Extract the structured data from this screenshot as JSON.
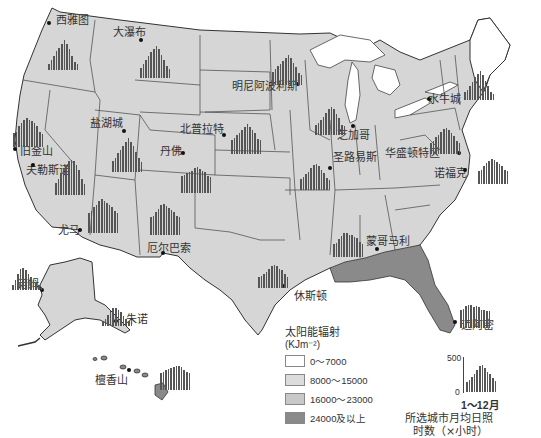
{
  "map": {
    "subject": "美国太阳能辐射与主要城市月均日照时数",
    "colors": {
      "water_bg": "#ffffff",
      "class_0_7000": "#ffffff",
      "class_8000_15000": "#d9d9d9",
      "class_16000_23000": "#cfcfcf",
      "class_24000_plus": "#8a8a8a",
      "border": "#333333",
      "bars": "#555555"
    }
  },
  "cities": [
    {
      "name": "西雅图",
      "label_x": 56,
      "label_y": 15,
      "dot_x": 49,
      "dot_y": 23,
      "hist_x": 48,
      "hist_y": 30,
      "values": [
        80,
        120,
        180,
        240,
        280,
        330,
        380,
        330,
        260,
        180,
        100,
        70
      ]
    },
    {
      "name": "大瀑布",
      "label_x": 113,
      "label_y": 27,
      "dot_x": 141,
      "dot_y": 40,
      "hist_x": 140,
      "hist_y": 38,
      "values": [
        120,
        170,
        230,
        280,
        320,
        360,
        400,
        360,
        290,
        220,
        150,
        110
      ]
    },
    {
      "name": "明尼阿波利斯",
      "label_x": 232,
      "label_y": 81,
      "dot_x": 298,
      "dot_y": 84,
      "hist_x": 272,
      "hist_y": 45,
      "values": [
        160,
        200,
        240,
        260,
        300,
        340,
        380,
        340,
        280,
        220,
        150,
        130
      ]
    },
    {
      "name": "水牛城",
      "label_x": 428,
      "label_y": 94,
      "dot_x": 429,
      "dot_y": 99,
      "hist_x": 464,
      "hist_y": 60,
      "values": [
        100,
        130,
        180,
        230,
        290,
        330,
        360,
        310,
        240,
        180,
        100,
        80
      ]
    },
    {
      "name": "盐湖城",
      "label_x": 90,
      "label_y": 118,
      "dot_x": 124,
      "dot_y": 131,
      "hist_x": 112,
      "hist_y": 132,
      "values": [
        140,
        170,
        240,
        280,
        330,
        380,
        420,
        380,
        320,
        250,
        170,
        130
      ]
    },
    {
      "name": "北普拉特",
      "label_x": 180,
      "label_y": 124,
      "dot_x": 224,
      "dot_y": 135,
      "hist_x": 231,
      "hist_y": 114,
      "values": [
        180,
        200,
        240,
        260,
        300,
        340,
        380,
        340,
        300,
        260,
        190,
        170
      ]
    },
    {
      "name": "芝加哥",
      "label_x": 337,
      "label_y": 130,
      "dot_x": 353,
      "dot_y": 126,
      "hist_x": 315,
      "hist_y": 95,
      "values": [
        130,
        150,
        190,
        230,
        280,
        320,
        350,
        320,
        260,
        210,
        130,
        110
      ]
    },
    {
      "name": "旧金山",
      "label_x": 20,
      "label_y": 146,
      "dot_x": 15,
      "dot_y": 149,
      "hist_x": 13,
      "hist_y": 107,
      "values": [
        170,
        190,
        260,
        300,
        340,
        360,
        340,
        320,
        300,
        260,
        190,
        160
      ]
    },
    {
      "name": "丹佛",
      "label_x": 160,
      "label_y": 146,
      "dot_x": 183,
      "dot_y": 153,
      "hist_x": 181,
      "hist_y": 153,
      "values": [
        210,
        220,
        250,
        260,
        280,
        310,
        320,
        300,
        280,
        260,
        210,
        200
      ]
    },
    {
      "name": "圣路易斯",
      "label_x": 333,
      "label_y": 152,
      "dot_x": 330,
      "dot_y": 168,
      "hist_x": 300,
      "hist_y": 150,
      "values": [
        140,
        160,
        200,
        230,
        280,
        310,
        330,
        300,
        250,
        210,
        150,
        130
      ]
    },
    {
      "name": "华盛顿特区",
      "label_x": 385,
      "label_y": 148,
      "dot_x": 459,
      "dot_y": 153,
      "hist_x": 430,
      "hist_y": 114,
      "values": [
        140,
        160,
        210,
        240,
        280,
        310,
        330,
        300,
        260,
        220,
        160,
        140
      ]
    },
    {
      "name": "夫勒斯诺",
      "label_x": 26,
      "label_y": 165,
      "dot_x": 33,
      "dot_y": 165,
      "hist_x": 55,
      "hist_y": 155,
      "values": [
        150,
        200,
        270,
        320,
        380,
        420,
        440,
        420,
        370,
        310,
        200,
        140
      ]
    },
    {
      "name": "诺福克",
      "label_x": 434,
      "label_y": 168,
      "dot_x": 465,
      "dot_y": 170,
      "hist_x": 478,
      "hist_y": 144,
      "values": [
        160,
        180,
        220,
        260,
        290,
        310,
        300,
        280,
        250,
        230,
        180,
        160
      ]
    },
    {
      "name": "尤马",
      "label_x": 58,
      "label_y": 225,
      "dot_x": 80,
      "dot_y": 230,
      "hist_x": 88,
      "hist_y": 193,
      "values": [
        250,
        270,
        320,
        350,
        400,
        420,
        400,
        380,
        350,
        320,
        270,
        250
      ]
    },
    {
      "name": "厄尔巴索",
      "label_x": 147,
      "label_y": 243,
      "dot_x": 163,
      "dot_y": 253,
      "hist_x": 150,
      "hist_y": 195,
      "values": [
        220,
        240,
        290,
        330,
        370,
        390,
        360,
        340,
        310,
        290,
        240,
        220
      ]
    },
    {
      "name": "蒙哥马利",
      "label_x": 366,
      "label_y": 236,
      "dot_x": 377,
      "dot_y": 249,
      "hist_x": 333,
      "hist_y": 217,
      "values": [
        160,
        180,
        220,
        260,
        300,
        300,
        280,
        270,
        250,
        240,
        190,
        160
      ]
    },
    {
      "name": "休斯顿",
      "label_x": 294,
      "label_y": 291,
      "dot_x": 283,
      "dot_y": 286,
      "hist_x": 258,
      "hist_y": 248,
      "values": [
        140,
        150,
        180,
        200,
        240,
        280,
        290,
        280,
        240,
        230,
        170,
        140
      ]
    },
    {
      "name": "诺姆",
      "label_x": 17,
      "label_y": 279,
      "dot_x": 42,
      "dot_y": 290,
      "hist_x": 12,
      "hist_y": 250,
      "values": [
        60,
        120,
        200,
        260,
        280,
        250,
        200,
        160,
        130,
        90,
        60,
        40
      ]
    },
    {
      "name": "朱诺",
      "label_x": 126,
      "label_y": 314,
      "dot_x": 116,
      "dot_y": 321,
      "hist_x": 102,
      "hist_y": 286,
      "values": [
        60,
        90,
        140,
        190,
        230,
        220,
        200,
        180,
        130,
        90,
        60,
        50
      ]
    },
    {
      "name": "迈阿密",
      "label_x": 461,
      "label_y": 320,
      "dot_x": 455,
      "dot_y": 322,
      "hist_x": 460,
      "hist_y": 288,
      "values": [
        220,
        240,
        270,
        290,
        290,
        260,
        270,
        260,
        230,
        230,
        210,
        210
      ]
    },
    {
      "name": "檀香山",
      "label_x": 95,
      "label_y": 375,
      "dot_x": 129,
      "dot_y": 370,
      "hist_x": 160,
      "hist_y": 350,
      "values": [
        210,
        220,
        250,
        260,
        280,
        290,
        300,
        300,
        290,
        250,
        220,
        210
      ]
    }
  ],
  "legend": {
    "title": "太阳能辐射",
    "unit": "(KJm⁻²)",
    "items": [
      {
        "label": "0～7000",
        "color": "#ffffff"
      },
      {
        "label": "8000～15000",
        "color": "#dcdcdc"
      },
      {
        "label": "16000～23000",
        "color": "#c8c8c8"
      },
      {
        "label": "24000及以上",
        "color": "#8a8a8a"
      }
    ]
  },
  "key": {
    "tick_max": "500",
    "tick_min": "0",
    "months": "1～12月",
    "caption_line1": "所选城市月均日照",
    "caption_line2": "时数（×小时）",
    "values": [
      150,
      180,
      220,
      260,
      320,
      380,
      400,
      360,
      300,
      260,
      200,
      160
    ]
  }
}
